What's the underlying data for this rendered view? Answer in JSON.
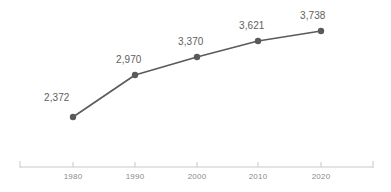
{
  "chart_data": {
    "type": "line",
    "title": "",
    "subtitle": "",
    "xlabel": "",
    "ylabel": "",
    "categories": [
      "1980",
      "1990",
      "2000",
      "2010",
      "2020"
    ],
    "values": [
      2372,
      2970,
      3370,
      3621,
      3738
    ],
    "value_labels": [
      "2,372",
      "2,970",
      "3,370",
      "3,621",
      "3,738"
    ],
    "series": [
      {
        "name": "",
        "values": [
          2372,
          2970,
          3370,
          3621,
          3738
        ]
      }
    ],
    "xlim": [
      1975,
      2025
    ],
    "ylim": [
      2200,
      3850
    ],
    "grid": false,
    "legend": false,
    "legend_position": "none",
    "axis_visible": {
      "x": true,
      "y": false
    },
    "markers": true,
    "colors": {
      "line": "#5a5a5a",
      "marker": "#5a5a5a",
      "data_label": "#5e5e5e",
      "tick_label": "#8a8a8a",
      "axis": "#c9c9c9",
      "background": "#ffffff"
    },
    "points": [
      {
        "x": 73,
        "y": 117,
        "label": "2,372",
        "category": "1980",
        "label_x": 44,
        "label_y": 92
      },
      {
        "x": 135,
        "y": 75,
        "label": "2,970",
        "category": "1990",
        "label_x": 116,
        "label_y": 54
      },
      {
        "x": 197,
        "y": 57,
        "label": "3,370",
        "category": "2000",
        "label_x": 178,
        "label_y": 36
      },
      {
        "x": 258,
        "y": 41,
        "label": "3,621",
        "category": "2010",
        "label_x": 239,
        "label_y": 20
      },
      {
        "x": 321,
        "y": 31,
        "label": "3,738",
        "category": "2020",
        "label_x": 300,
        "label_y": 10
      }
    ],
    "axis": {
      "y": 167,
      "x_start": 20,
      "x_end": 373,
      "tick_height": 5,
      "ticks": [
        73,
        135,
        197,
        258,
        321
      ],
      "end_caps": [
        20,
        373
      ]
    }
  }
}
